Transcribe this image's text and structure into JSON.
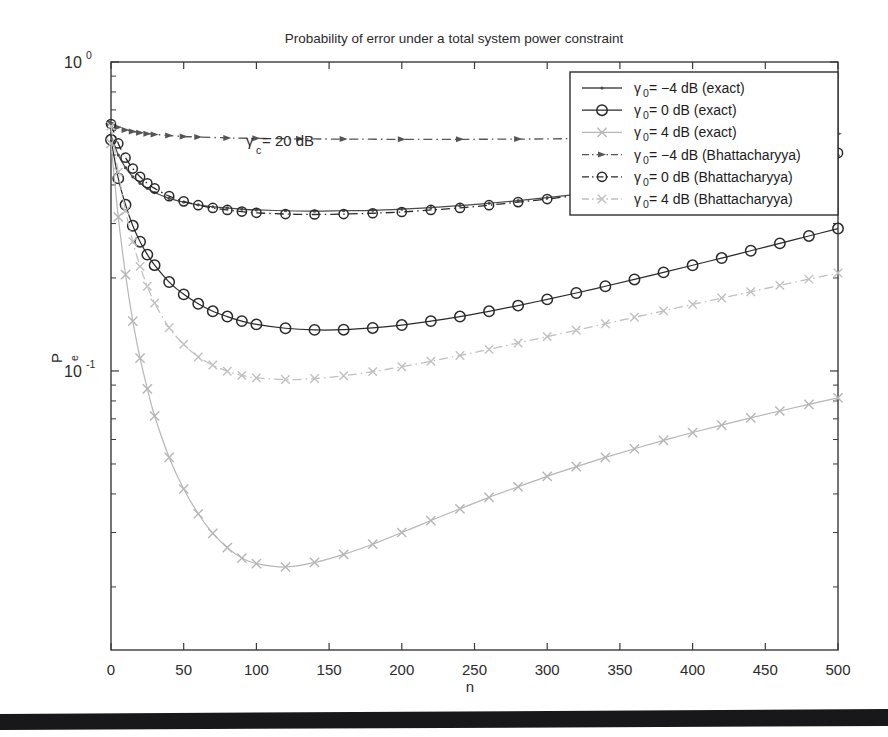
{
  "chart_data": {
    "type": "line",
    "title": "Probability of error under a total system power constraint",
    "xlabel": "n",
    "ylabel": "Pe",
    "ylabel_base": "P",
    "ylabel_sub": "e",
    "yscale": "log",
    "xlim": [
      0,
      500
    ],
    "ylim": [
      0.0125,
      1.0
    ],
    "grid": false,
    "legend_position": "upper right",
    "annotation": {
      "text_base": "γ",
      "text_sub": "c",
      "text_rest": " = 20 dB",
      "full": "γc = 20 dB",
      "x": 52,
      "y": 0.46
    },
    "xticks": [
      0,
      50,
      100,
      150,
      200,
      250,
      300,
      350,
      400,
      450,
      500
    ],
    "xticklabels": [
      "0",
      "50",
      "100",
      "150",
      "200",
      "250",
      "300",
      "350",
      "400",
      "450",
      "500"
    ],
    "yticks": [
      1.0,
      0.1
    ],
    "yticklabels": [
      "10 0",
      "10 -1"
    ],
    "ytick_bases": [
      "10",
      "10"
    ],
    "ytick_exps": [
      "0",
      "-1"
    ],
    "series": [
      {
        "name": "γ₀ = −4 dB (exact)",
        "legend_base": "γ",
        "legend_sub": "0",
        "legend_rest": " = −4 dB (exact)",
        "marker": "dot",
        "linestyle": "solid",
        "color": "#4a4a4a",
        "x": [
          0,
          5,
          10,
          15,
          20,
          25,
          30,
          40,
          50,
          60,
          70,
          80,
          90,
          100,
          120,
          140,
          160,
          180,
          200,
          220,
          240,
          260,
          280,
          300,
          320,
          340,
          360,
          380,
          400,
          420,
          440,
          460,
          480,
          500
        ],
        "y": [
          0.58,
          0.5,
          0.455,
          0.425,
          0.405,
          0.39,
          0.378,
          0.362,
          0.352,
          0.345,
          0.34,
          0.337,
          0.334,
          0.332,
          0.33,
          0.329,
          0.33,
          0.331,
          0.334,
          0.338,
          0.343,
          0.349,
          0.356,
          0.364,
          0.373,
          0.383,
          0.394,
          0.406,
          0.419,
          0.433,
          0.448,
          0.464,
          0.481,
          0.499
        ]
      },
      {
        "name": "γ₀ = 0 dB (exact)",
        "legend_base": "γ",
        "legend_sub": "0",
        "legend_rest": " = 0 dB (exact)",
        "marker": "circle",
        "linestyle": "solid",
        "color": "#2a2a2a",
        "x": [
          0,
          5,
          10,
          15,
          20,
          25,
          30,
          40,
          50,
          60,
          70,
          80,
          90,
          100,
          120,
          140,
          160,
          180,
          200,
          220,
          240,
          260,
          280,
          300,
          320,
          340,
          360,
          380,
          400,
          420,
          440,
          460,
          480,
          500
        ],
        "y": [
          0.56,
          0.42,
          0.345,
          0.295,
          0.262,
          0.238,
          0.22,
          0.194,
          0.177,
          0.165,
          0.156,
          0.15,
          0.145,
          0.1415,
          0.1375,
          0.1358,
          0.136,
          0.1378,
          0.1408,
          0.145,
          0.15,
          0.156,
          0.1628,
          0.1705,
          0.1788,
          0.188,
          0.1978,
          0.2085,
          0.2198,
          0.232,
          0.245,
          0.2588,
          0.2735,
          0.289
        ]
      },
      {
        "name": "γ₀ = 4 dB (exact)",
        "legend_base": "γ",
        "legend_sub": "0",
        "legend_rest": " = 4 dB (exact)",
        "marker": "cross",
        "linestyle": "solid",
        "color": "#b6b6b6",
        "x": [
          0,
          5,
          10,
          15,
          20,
          25,
          30,
          40,
          50,
          60,
          70,
          80,
          90,
          100,
          120,
          140,
          160,
          180,
          200,
          220,
          240,
          260,
          280,
          300,
          320,
          340,
          360,
          380,
          400,
          420,
          440,
          460,
          480,
          500
        ],
        "y": [
          0.545,
          0.315,
          0.205,
          0.145,
          0.11,
          0.0875,
          0.0715,
          0.0525,
          0.0415,
          0.0345,
          0.0298,
          0.0268,
          0.0248,
          0.0238,
          0.0232,
          0.024,
          0.0255,
          0.0275,
          0.03,
          0.0328,
          0.0358,
          0.039,
          0.0422,
          0.0456,
          0.049,
          0.0525,
          0.056,
          0.0596,
          0.0632,
          0.0668,
          0.0705,
          0.0742,
          0.078,
          0.0818
        ]
      },
      {
        "name": "γ₀ = −4 dB (Bhattacharyya)",
        "legend_base": "γ",
        "legend_sub": "0",
        "legend_rest": " = −4 dB (Bhattacharyya)",
        "marker": "arrow",
        "linestyle": "dashdot",
        "color": "#555555",
        "x": [
          0,
          5,
          10,
          15,
          20,
          25,
          30,
          40,
          50,
          60,
          80,
          100,
          130,
          160,
          200,
          240,
          280,
          320,
          360,
          400,
          440,
          470,
          500
        ],
        "y": [
          0.635,
          0.615,
          0.603,
          0.596,
          0.59,
          0.586,
          0.583,
          0.578,
          0.574,
          0.572,
          0.568,
          0.566,
          0.564,
          0.563,
          0.562,
          0.562,
          0.563,
          0.565,
          0.568,
          0.572,
          0.577,
          0.581,
          0.586
        ]
      },
      {
        "name": "γ₀ = 0 dB (Bhattacharyya)",
        "legend_base": "γ",
        "legend_sub": "0",
        "legend_rest": " = 0 dB (Bhattacharyya)",
        "marker": "circle",
        "linestyle": "dashdot",
        "color": "#2a2a2a",
        "x": [
          0,
          5,
          10,
          15,
          20,
          25,
          30,
          40,
          50,
          60,
          70,
          80,
          90,
          100,
          120,
          140,
          160,
          180,
          200,
          220,
          240,
          260,
          280,
          300,
          320,
          340,
          360,
          380,
          400,
          420,
          440,
          460,
          480,
          500
        ],
        "y": [
          0.63,
          0.545,
          0.49,
          0.452,
          0.425,
          0.405,
          0.39,
          0.368,
          0.354,
          0.344,
          0.337,
          0.332,
          0.328,
          0.325,
          0.322,
          0.321,
          0.322,
          0.324,
          0.327,
          0.332,
          0.337,
          0.344,
          0.352,
          0.36,
          0.37,
          0.381,
          0.393,
          0.406,
          0.42,
          0.435,
          0.452,
          0.469,
          0.488,
          0.508
        ]
      },
      {
        "name": "γ₀ = 4 dB (Bhattacharyya)",
        "legend_base": "γ",
        "legend_sub": "0",
        "legend_rest": " = 4 dB (Bhattacharyya)",
        "marker": "cross",
        "linestyle": "dashdot",
        "color": "#c0c0c0",
        "x": [
          0,
          5,
          10,
          15,
          20,
          25,
          30,
          40,
          50,
          60,
          70,
          80,
          90,
          100,
          120,
          140,
          160,
          180,
          200,
          220,
          240,
          260,
          280,
          300,
          320,
          340,
          360,
          380,
          400,
          420,
          440,
          460,
          480,
          500
        ],
        "y": [
          0.62,
          0.44,
          0.33,
          0.262,
          0.218,
          0.188,
          0.166,
          0.138,
          0.122,
          0.111,
          0.1045,
          0.0998,
          0.0968,
          0.095,
          0.0938,
          0.0945,
          0.0965,
          0.0995,
          0.1032,
          0.1075,
          0.1122,
          0.1175,
          0.1232,
          0.1292,
          0.1355,
          0.1422,
          0.1492,
          0.1565,
          0.1642,
          0.1722,
          0.1805,
          0.1892,
          0.1982,
          0.2075
        ]
      }
    ]
  },
  "figure": {
    "background": "#ffffff",
    "axis_color": "#3a3a3a",
    "scan_bar_color": "#18181a"
  }
}
